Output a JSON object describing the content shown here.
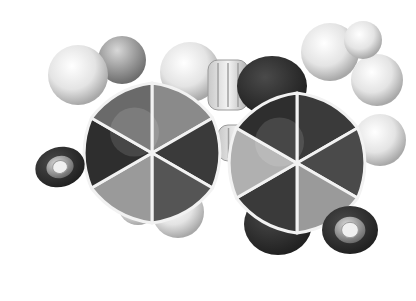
{
  "image": {
    "width": 416,
    "height": 301,
    "background": "#ffffff",
    "subject": "grayscale space-filling molecular model (two fused/linked six-membered rings)"
  },
  "palette": {
    "dark": "#2a2a2a",
    "mid_dark": "#4a4a4a",
    "mid": "#7a7a7a",
    "light": "#b5b5b5",
    "pale": "#e6e6e6",
    "seam": "#f2f2f2"
  },
  "left_ring": {
    "center": [
      152,
      153
    ],
    "radius": 70,
    "sector_fills": [
      "#8a8a8a",
      "#3a3a3a",
      "#555555",
      "#9a9a9a",
      "#2e2e2e",
      "#6a6a6a"
    ]
  },
  "right_ring": {
    "center": [
      297,
      163
    ],
    "radius": 70,
    "sector_fills": [
      "#3a3a3a",
      "#4a4a4a",
      "#9a9a9a",
      "#3a3a3a",
      "#b0b0b0",
      "#2e2e2e"
    ]
  },
  "white_spheres": [
    {
      "cx": 78,
      "cy": 75,
      "r": 30
    },
    {
      "cx": 190,
      "cy": 72,
      "r": 30
    },
    {
      "cx": 330,
      "cy": 52,
      "r": 29
    },
    {
      "cx": 377,
      "cy": 80,
      "r": 26
    },
    {
      "cx": 363,
      "cy": 40,
      "r": 19
    },
    {
      "cx": 380,
      "cy": 140,
      "r": 26
    },
    {
      "cx": 178,
      "cy": 212,
      "r": 26
    },
    {
      "cx": 138,
      "cy": 205,
      "r": 20
    }
  ],
  "dark_lobes": [
    {
      "cx": 272,
      "cy": 86,
      "rx": 35,
      "ry": 30
    },
    {
      "cx": 278,
      "cy": 224,
      "rx": 34,
      "ry": 31
    }
  ],
  "end_caps": [
    {
      "cx": 60,
      "cy": 167,
      "rx": 25,
      "ry": 20,
      "angle": -15
    },
    {
      "cx": 350,
      "cy": 230,
      "rx": 28,
      "ry": 24,
      "angle": 0
    }
  ],
  "connectors": [
    {
      "x": 208,
      "y": 60,
      "w": 40,
      "h": 50
    },
    {
      "x": 218,
      "y": 125,
      "w": 42,
      "h": 36
    }
  ],
  "top_cap_sphere": {
    "cx": 122,
    "cy": 60,
    "r": 24
  }
}
